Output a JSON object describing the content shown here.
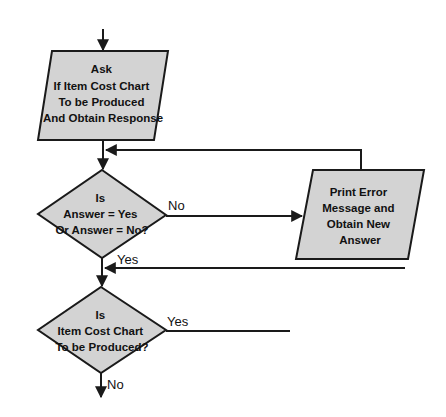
{
  "diagram": {
    "type": "flowchart",
    "colors": {
      "shape_fill": "#d3d3d3",
      "stroke": "#1a1a1a",
      "text": "#111111"
    },
    "nodes": {
      "ask": {
        "shape": "parallelogram",
        "lines": [
          "Ask",
          "If Item Cost Chart",
          "To be Produced",
          "And Obtain Response"
        ]
      },
      "decision_valid": {
        "shape": "diamond",
        "lines": [
          "Is",
          "Answer = Yes",
          "Or Answer = No?"
        ]
      },
      "error": {
        "shape": "parallelogram",
        "lines": [
          "Print Error",
          "Message and",
          "Obtain New",
          "Answer"
        ]
      },
      "decision_chart": {
        "shape": "diamond",
        "lines": [
          "Is",
          "Item Cost Chart",
          "To be Produced?"
        ]
      }
    },
    "edges": {
      "valid_no": "No",
      "valid_yes": "Yes",
      "chart_yes": "Yes",
      "chart_no": "No"
    }
  }
}
